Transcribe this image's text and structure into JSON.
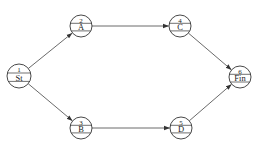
{
  "diagram": {
    "type": "activity-on-node network",
    "nodes": [
      {
        "id": "1",
        "number": "1",
        "label": "St",
        "cx": 19,
        "cy": 76,
        "r": 12
      },
      {
        "id": "2",
        "number": "2",
        "label": "A",
        "cx": 81,
        "cy": 26,
        "r": 11
      },
      {
        "id": "3",
        "number": "3",
        "label": "B",
        "cx": 81,
        "cy": 128,
        "r": 11
      },
      {
        "id": "4",
        "number": "4",
        "label": "C",
        "cx": 180,
        "cy": 26,
        "r": 11
      },
      {
        "id": "5",
        "number": "5",
        "label": "D",
        "cx": 181,
        "cy": 128,
        "r": 11
      },
      {
        "id": "6",
        "number": "6",
        "label": "Fin",
        "cx": 240,
        "cy": 77,
        "r": 11
      }
    ],
    "edges": [
      {
        "from": "1",
        "to": "2"
      },
      {
        "from": "1",
        "to": "3"
      },
      {
        "from": "2",
        "to": "4"
      },
      {
        "from": "3",
        "to": "5"
      },
      {
        "from": "4",
        "to": "6"
      },
      {
        "from": "5",
        "to": "6"
      }
    ],
    "colors": {
      "line": "#333333",
      "background": "#ffffff"
    }
  }
}
